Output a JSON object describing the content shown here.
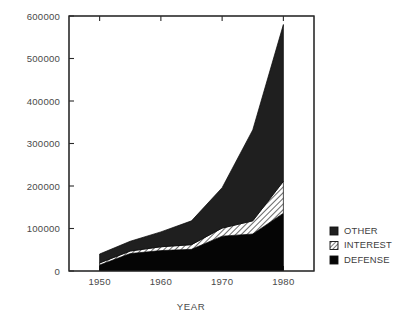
{
  "chart_data": {
    "type": "area",
    "stacked": true,
    "title": "",
    "xlabel": "YEAR",
    "ylabel": "",
    "x": [
      1950,
      1955,
      1960,
      1965,
      1970,
      1975,
      1980
    ],
    "xlim": [
      1945,
      1985
    ],
    "ylim": [
      0,
      600000
    ],
    "ytick_values": [
      0,
      100000,
      200000,
      300000,
      400000,
      500000,
      600000
    ],
    "ytick_labels": [
      "0",
      "100000",
      "200000",
      "300000",
      "400000",
      "500000",
      "600000"
    ],
    "xtick_values": [
      1950,
      1960,
      1970,
      1980
    ],
    "xtick_labels": [
      "1950",
      "1960",
      "1970",
      "1980"
    ],
    "grid": false,
    "legend_position": "right",
    "series": [
      {
        "name": "DEFENSE",
        "fill": "solid-black",
        "color": "#050505",
        "values": [
          14000,
          41000,
          48000,
          51000,
          82000,
          87000,
          136000
        ]
      },
      {
        "name": "INTEREST",
        "fill": "hatched",
        "color": "#ffffff",
        "values": [
          5000,
          6000,
          9000,
          11000,
          19000,
          31000,
          75000
        ]
      },
      {
        "name": "OTHER",
        "fill": "solid-dark",
        "color": "#1f1f1f",
        "values": [
          21000,
          23000,
          35000,
          56000,
          95000,
          214000,
          369000
        ]
      }
    ],
    "totals": [
      40000,
      70000,
      92000,
      118000,
      196000,
      332000,
      580000
    ]
  },
  "legend": {
    "items": [
      {
        "label": "OTHER",
        "swatch": "solid-dark-swatch"
      },
      {
        "label": "INTEREST",
        "swatch": "hatched-swatch"
      },
      {
        "label": "DEFENSE",
        "swatch": "solid-black-swatch"
      }
    ]
  },
  "axes": {
    "x_title": "YEAR"
  }
}
